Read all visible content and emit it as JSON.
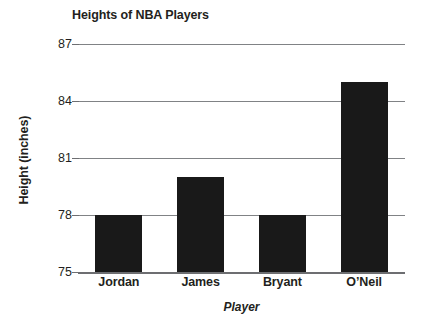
{
  "chart_data": {
    "type": "bar",
    "title": "Heights of NBA Players",
    "xlabel": "Player",
    "ylabel": "Height (inches)",
    "categories": [
      "Jordan",
      "James",
      "Bryant",
      "O’Neil"
    ],
    "values": [
      78,
      80,
      78,
      85
    ],
    "ylim": [
      75,
      87
    ],
    "yticks": [
      75,
      78,
      81,
      84,
      87
    ],
    "ytick_labels": [
      "75",
      "78",
      "81",
      "84",
      "87"
    ],
    "grid": true,
    "legend": false,
    "series": [
      {
        "name": "Height (inches)",
        "values": [
          78,
          80,
          78,
          85
        ]
      }
    ],
    "bar_color": "#191919",
    "gridline_color": "#808285",
    "text_color": "#231f20"
  },
  "axes": {
    "y_title": "Height (inches)",
    "x_title": "Player"
  }
}
